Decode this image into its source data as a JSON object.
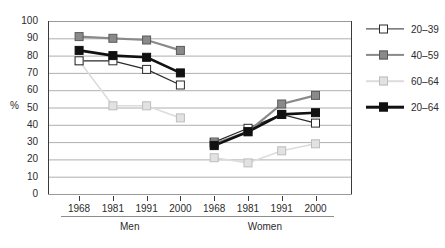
{
  "chart_data": {
    "type": "line",
    "title": "",
    "xlabel": "",
    "ylabel": "%",
    "ylim": [
      0,
      100
    ],
    "ytick_step": 10,
    "yticks": [
      100,
      90,
      80,
      70,
      60,
      50,
      40,
      30,
      20,
      10,
      0
    ],
    "grid": true,
    "legend_position": "right",
    "groups": [
      {
        "name": "Men",
        "categories": [
          "1968",
          "1981",
          "1991",
          "2000"
        ],
        "series": [
          {
            "name": "20–39",
            "values": [
              77,
              77,
              72,
              63
            ]
          },
          {
            "name": "40–59",
            "values": [
              91,
              90,
              89,
              83
            ]
          },
          {
            "name": "60–64",
            "values": [
              77,
              51,
              51,
              44
            ]
          },
          {
            "name": "20–64",
            "values": [
              83,
              80,
              79,
              70
            ]
          }
        ]
      },
      {
        "name": "Women",
        "categories": [
          "1968",
          "1981",
          "1991",
          "2000"
        ],
        "series": [
          {
            "name": "20–39",
            "values": [
              30,
              38,
              46,
              41
            ]
          },
          {
            "name": "40–59",
            "values": [
              29,
              36,
              52,
              57
            ]
          },
          {
            "name": "60–64",
            "values": [
              21,
              18,
              25,
              29
            ]
          },
          {
            "name": "20–64",
            "values": [
              28,
              36,
              46,
              47
            ]
          }
        ]
      }
    ],
    "legend": [
      {
        "label": "20–39",
        "marker": "open-square",
        "fill": "#ffffff",
        "stroke": "#2b2b2b",
        "line": "#2b2b2b",
        "line_width": 1.2
      },
      {
        "label": "40–59",
        "marker": "filled-square",
        "fill": "#8a8a8a",
        "stroke": "#5a5a5a",
        "line": "#8a8a8a",
        "line_width": 2.2
      },
      {
        "label": "60–64",
        "marker": "light-square",
        "fill": "#e2e2e2",
        "stroke": "#bdbdbd",
        "line": "#dcdcdc",
        "line_width": 1.6
      },
      {
        "label": "20–64",
        "marker": "black-square",
        "fill": "#111111",
        "stroke": "#111111",
        "line": "#111111",
        "line_width": 2.6
      }
    ],
    "colors": {
      "grid": "#9a9a9a",
      "axis": "#3a3a3a",
      "text": "#2b2b2b",
      "background": "#ffffff"
    }
  }
}
